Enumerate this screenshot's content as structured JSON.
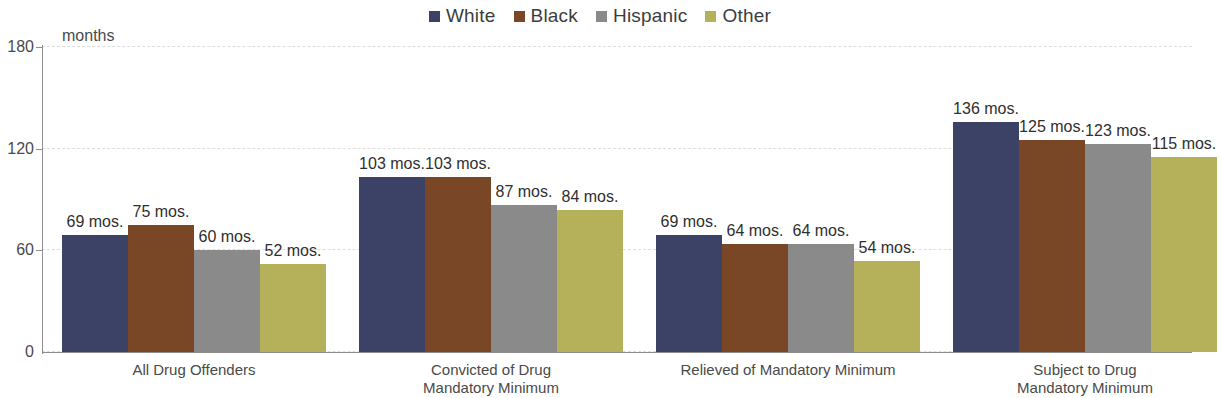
{
  "legend": {
    "position": "top-center",
    "items": [
      {
        "label": "White",
        "color": "#3b4266"
      },
      {
        "label": "Black",
        "color": "#7a4726"
      },
      {
        "label": "Hispanic",
        "color": "#8a8a8a"
      },
      {
        "label": "Other",
        "color": "#b5b05a"
      }
    ]
  },
  "axis": {
    "y_title": "months",
    "y_ticks": [
      "180",
      "120",
      "60",
      "0"
    ]
  },
  "chart_data": {
    "type": "bar",
    "title": "",
    "subtitle": "",
    "xlabel": "",
    "ylabel": "months",
    "ylim": [
      0,
      180
    ],
    "ytick_values": [
      0,
      60,
      120,
      180
    ],
    "grid": true,
    "legend_position": "top-center",
    "value_suffix": "mos.",
    "categories": [
      "All Drug Offenders",
      "Convicted of Drug\nMandatory Minimum",
      "Relieved of Mandatory Minimum",
      "Subject to Drug\nMandatory Minimum"
    ],
    "series": [
      {
        "name": "White",
        "color": "#3b4266",
        "values": [
          69,
          103,
          69,
          136
        ]
      },
      {
        "name": "Black",
        "color": "#7a4726",
        "values": [
          75,
          103,
          64,
          125
        ]
      },
      {
        "name": "Hispanic",
        "color": "#8a8a8a",
        "values": [
          60,
          87,
          64,
          123
        ]
      },
      {
        "name": "Other",
        "color": "#b5b05a",
        "values": [
          52,
          84,
          54,
          115
        ]
      }
    ],
    "data_labels": [
      [
        "69 mos.",
        "75 mos.",
        "60 mos.",
        "52 mos."
      ],
      [
        "103 mos.",
        "103 mos.",
        "87 mos.",
        "84 mos."
      ],
      [
        "69 mos.",
        "64 mos.",
        "64 mos.",
        "54 mos."
      ],
      [
        "136 mos.",
        "125 mos.",
        "123 mos.",
        "115 mos."
      ]
    ]
  }
}
